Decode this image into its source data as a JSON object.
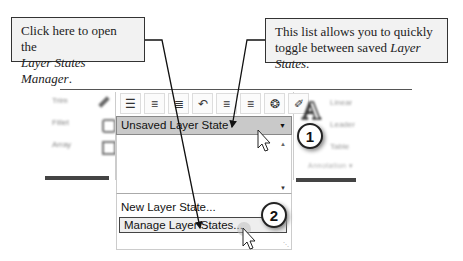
{
  "callouts": {
    "left": {
      "prefix": "Click here to open the",
      "italic": "Layer States Manager",
      "suffix": "."
    },
    "right": {
      "prefix": "This list allows you to quickly toggle between saved",
      "italic": "Layer States",
      "suffix": "."
    }
  },
  "ribbon": {
    "modify_panel": {
      "rows": [
        "Trim",
        "Fillet",
        "Array"
      ]
    },
    "layer_toolbar": {
      "icons": [
        "layer-properties-icon",
        "layer-state-icon",
        "layer-match-icon",
        "layer-previous-icon",
        "layer-isolate-icon",
        "layer-unisolate-icon",
        "layer-freeze-icon",
        "layer-off-icon"
      ],
      "glyphs": [
        "☰",
        "≡",
        "≣",
        "↶",
        "≡",
        "≡",
        "❂",
        "✐"
      ]
    },
    "layer_state_dropdown": {
      "selected": "Unsaved Layer State",
      "arrow": "▼"
    },
    "menu": {
      "items": [
        "New Layer State...",
        "Manage Layer States..."
      ]
    },
    "annotation_panel": {
      "big_letter": "A",
      "rows": [
        "Linear",
        "Leader",
        "Table"
      ],
      "title": "Annotation ▾"
    }
  },
  "badges": {
    "step1": "1",
    "step2": "2"
  }
}
